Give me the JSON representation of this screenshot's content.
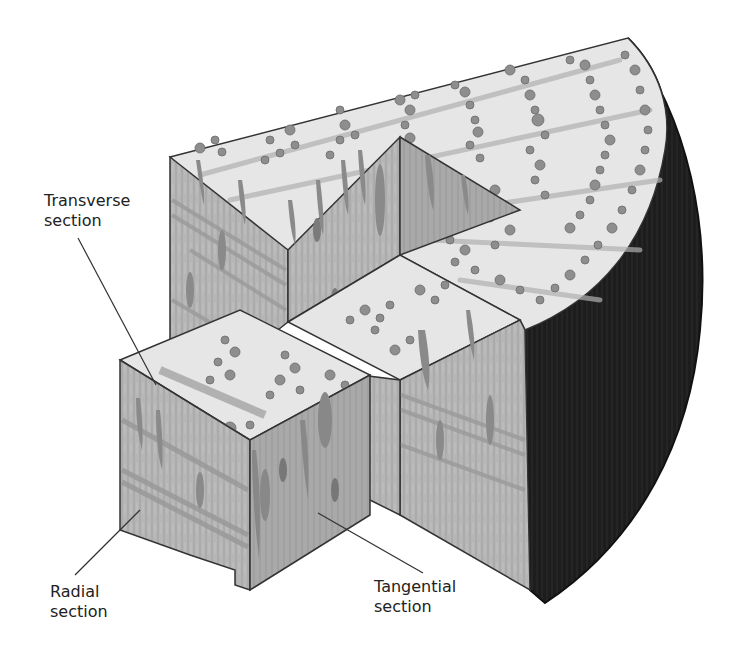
{
  "figure": {
    "labels": {
      "transverse": {
        "line1": "Transverse",
        "line2": "section"
      },
      "radial": {
        "line1": "Radial",
        "line2": "section"
      },
      "tangential": {
        "line1": "Tangential",
        "line2": "section"
      }
    },
    "colors": {
      "top_face": "#e4e4e4",
      "side_face": "#b3b3b3",
      "side_face_dark": "#a4a4a4",
      "vessel": "#8f8f8f",
      "ray": "#a8a8a8",
      "bark": "#1f1f1f",
      "outline": "#333333"
    }
  }
}
